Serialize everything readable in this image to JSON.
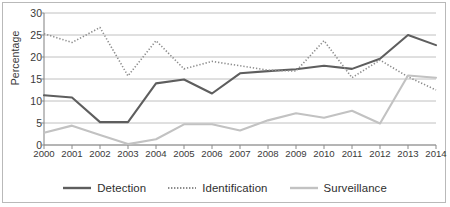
{
  "chart_data": {
    "type": "line",
    "title": "",
    "xlabel": "",
    "ylabel": "Percentage",
    "ylim": [
      0,
      30
    ],
    "ytick_step": 5,
    "yticks": [
      "0",
      "5",
      "10",
      "15",
      "20",
      "25",
      "30"
    ],
    "grid": "horizontal",
    "legend_position": "bottom",
    "categories": [
      "2000",
      "2001",
      "2002",
      "2003",
      "2004",
      "2005",
      "2006",
      "2007",
      "2008",
      "2009",
      "2010",
      "2011",
      "2012",
      "2013",
      "2014"
    ],
    "series": [
      {
        "name": "Detection",
        "style": "solid",
        "color": "#5e5e5e",
        "values": [
          11.3,
          10.8,
          5.2,
          5.2,
          14.0,
          14.9,
          11.7,
          16.3,
          16.8,
          17.2,
          18.0,
          17.3,
          19.6,
          25.0,
          22.7
        ]
      },
      {
        "name": "Identification",
        "style": "dotted",
        "color": "#8c8c8c",
        "values": [
          25.3,
          23.3,
          26.7,
          15.7,
          23.7,
          17.3,
          19.0,
          18.0,
          17.0,
          16.8,
          23.7,
          15.3,
          19.3,
          15.5,
          12.5
        ]
      },
      {
        "name": "Surveillance",
        "style": "solid",
        "color": "#c2c2c2",
        "values": [
          2.8,
          4.4,
          2.3,
          0.2,
          1.3,
          4.7,
          4.7,
          3.3,
          5.6,
          7.2,
          6.2,
          7.8,
          4.9,
          15.8,
          15.3
        ]
      }
    ]
  },
  "axis": {
    "y_title": "Percentage"
  },
  "legend": {
    "items": [
      {
        "label": "Detection",
        "icon": "solid-line-swatch"
      },
      {
        "label": "Identification",
        "icon": "dotted-line-swatch"
      },
      {
        "label": "Surveillance",
        "icon": "solid-line-swatch"
      }
    ]
  },
  "colors": {
    "detection": "#5e5e5e",
    "identification": "#8c8c8c",
    "surveillance": "#c2c2c2",
    "grid": "#b9b9b9",
    "axis": "#8a8a8a",
    "text": "#3a3a3a",
    "frame": "#b9b9b9"
  }
}
